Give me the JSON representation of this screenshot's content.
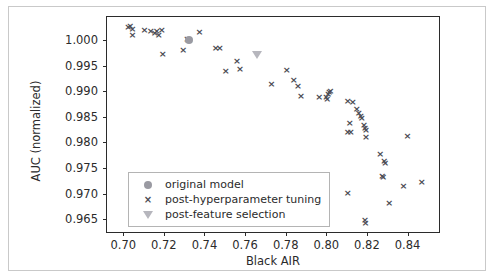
{
  "figure": {
    "caption_fragment": "",
    "legend": {
      "entries": [
        {
          "marker": "circle-marker",
          "label": "original model"
        },
        {
          "marker": "x-marker",
          "label": "post-hyperparameter tuning"
        },
        {
          "marker": "triangle-down-marker",
          "label": "post-feature selection"
        }
      ]
    }
  },
  "colors": {
    "x_marker": "#4a4a52",
    "circle_marker": "#9a9aa2",
    "triangle_marker": "#b6b6bd",
    "axis": "#2b2b2b",
    "frame": "#c9c9c9"
  },
  "chart_data": {
    "type": "scatter",
    "title": "",
    "xlabel": "Black AIR",
    "ylabel": "AUC (normalized)",
    "xlim": [
      0.692,
      0.8555
    ],
    "ylim": [
      0.9625,
      1.0045
    ],
    "grid": false,
    "legend_position": "lower left",
    "xticks": [
      0.7,
      0.72,
      0.74,
      0.76,
      0.78,
      0.8,
      0.82,
      0.84
    ],
    "xticklabels": [
      "0.70",
      "0.72",
      "0.74",
      "0.76",
      "0.78",
      "0.80",
      "0.82",
      "0.84"
    ],
    "yticks": [
      0.965,
      0.97,
      0.975,
      0.98,
      0.985,
      0.99,
      0.995,
      1.0
    ],
    "yticklabels": [
      "0.965",
      "0.970",
      "0.975",
      "0.980",
      "0.985",
      "0.990",
      "0.995",
      "1.000"
    ],
    "series": [
      {
        "name": "post-hyperparameter tuning",
        "marker": "x",
        "color": "#4a4a52",
        "points": [
          [
            0.7025,
            1.0025
          ],
          [
            0.7035,
            1.0028
          ],
          [
            0.7045,
            1.0022
          ],
          [
            0.7045,
            1.001
          ],
          [
            0.7105,
            1.002
          ],
          [
            0.7135,
            1.0017
          ],
          [
            0.7155,
            1.0013
          ],
          [
            0.7165,
            1.0018
          ],
          [
            0.7175,
            1.001
          ],
          [
            0.719,
            1.002
          ],
          [
            0.7195,
            0.9973
          ],
          [
            0.7295,
            0.998
          ],
          [
            0.7315,
            1.0003
          ],
          [
            0.732,
            1.0
          ],
          [
            0.7325,
            1.0001
          ],
          [
            0.7375,
            1.0015
          ],
          [
            0.7455,
            0.9985
          ],
          [
            0.7475,
            0.9985
          ],
          [
            0.7505,
            0.994
          ],
          [
            0.756,
            0.996
          ],
          [
            0.7575,
            0.9943
          ],
          [
            0.773,
            0.9914
          ],
          [
            0.7805,
            0.9941
          ],
          [
            0.784,
            0.9921
          ],
          [
            0.786,
            0.9911
          ],
          [
            0.7875,
            0.989
          ],
          [
            0.7965,
            0.9889
          ],
          [
            0.8,
            0.9888
          ],
          [
            0.8005,
            0.9885
          ],
          [
            0.801,
            0.9895
          ],
          [
            0.8015,
            0.9898
          ],
          [
            0.802,
            0.99
          ],
          [
            0.8105,
            0.988
          ],
          [
            0.813,
            0.9878
          ],
          [
            0.815,
            0.9866
          ],
          [
            0.816,
            0.9858
          ],
          [
            0.8115,
            0.9838
          ],
          [
            0.8105,
            0.9821
          ],
          [
            0.812,
            0.982
          ],
          [
            0.817,
            0.9852
          ],
          [
            0.8175,
            0.9848
          ],
          [
            0.8185,
            0.9834
          ],
          [
            0.819,
            0.9828
          ],
          [
            0.8195,
            0.9824
          ],
          [
            0.8195,
            0.981
          ],
          [
            0.8265,
            0.9777
          ],
          [
            0.8285,
            0.9764
          ],
          [
            0.829,
            0.976
          ],
          [
            0.8275,
            0.9735
          ],
          [
            0.828,
            0.9732
          ],
          [
            0.8105,
            0.9702
          ],
          [
            0.819,
            0.9648
          ],
          [
            0.8193,
            0.9642
          ],
          [
            0.831,
            0.9682
          ],
          [
            0.84,
            0.9812
          ],
          [
            0.838,
            0.9714
          ],
          [
            0.847,
            0.9723
          ]
        ]
      },
      {
        "name": "original model",
        "marker": "o",
        "color": "#9a9aa2",
        "points": [
          [
            0.7325,
            1.0
          ]
        ]
      },
      {
        "name": "post-feature selection",
        "marker": "v",
        "color": "#b6b6bd",
        "points": [
          [
            0.766,
            0.997
          ]
        ]
      }
    ]
  }
}
